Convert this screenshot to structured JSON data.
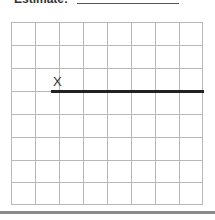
{
  "header": {
    "label": "Estimate:",
    "answer_value": ""
  },
  "grid": {
    "columns": 8,
    "rows": 8
  },
  "figure": {
    "marker_symbol": "X",
    "segment": "horizontal line segment starting below the X marker and extending to the right edge of the grid"
  }
}
